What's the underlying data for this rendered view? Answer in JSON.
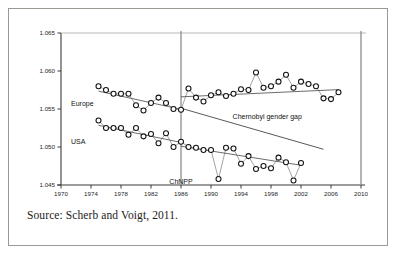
{
  "figure": {
    "source_caption": "Source: Scherb and Voigt, 2011."
  },
  "chart_data": {
    "type": "scatter",
    "title": "",
    "xlabel": "",
    "ylabel": "",
    "xlim": [
      1970,
      2010
    ],
    "ylim": [
      1.045,
      1.065
    ],
    "grid": false,
    "legend_position": "inline-labels",
    "xticks": [
      "1970",
      "1974",
      "1978",
      "1982",
      "1986",
      "1990",
      "1994",
      "1998",
      "2002",
      "2006",
      "2010"
    ],
    "xtick_values": [
      1970,
      1974,
      1978,
      1982,
      1986,
      1990,
      1994,
      1998,
      2002,
      2006,
      2010
    ],
    "yticks": [
      "1.065",
      "1.060",
      "1.055",
      "1.050",
      "1.045"
    ],
    "ytick_values": [
      1.065,
      1.06,
      1.055,
      1.05,
      1.045
    ],
    "series": [
      {
        "name": "Europe",
        "label": "Europe",
        "marker": "circle-open",
        "x": [
          1975,
          1976,
          1977,
          1978,
          1979,
          1980,
          1981,
          1982,
          1983,
          1984,
          1985,
          1986,
          1987,
          1988,
          1989,
          1990,
          1991,
          1992,
          1993,
          1994,
          1995,
          1996,
          1997,
          1998,
          1999,
          2000,
          2001,
          2002,
          2003,
          2004,
          2005,
          2006,
          2007
        ],
        "y": [
          1.058,
          1.0575,
          1.057,
          1.057,
          1.057,
          1.0555,
          1.0548,
          1.0558,
          1.0565,
          1.0558,
          1.055,
          1.0549,
          1.0577,
          1.0565,
          1.056,
          1.0568,
          1.0572,
          1.0567,
          1.057,
          1.0576,
          1.0575,
          1.0598,
          1.0578,
          1.058,
          1.0586,
          1.0595,
          1.0578,
          1.0586,
          1.0583,
          1.058,
          1.0564,
          1.0563,
          1.0572
        ]
      },
      {
        "name": "USA",
        "label": "USA",
        "marker": "circle-open",
        "x": [
          1975,
          1976,
          1977,
          1978,
          1979,
          1980,
          1981,
          1982,
          1983,
          1984,
          1985,
          1986,
          1987,
          1988,
          1989,
          1990,
          1991,
          1992,
          1993,
          1994,
          1995,
          1996,
          1997,
          1998,
          1999,
          2000,
          2001,
          2002
        ],
        "y": [
          1.0535,
          1.0525,
          1.0525,
          1.0525,
          1.0516,
          1.0525,
          1.0514,
          1.0517,
          1.0505,
          1.0518,
          1.05,
          1.0507,
          1.05,
          1.0499,
          1.0496,
          1.0496,
          1.0458,
          1.0499,
          1.0498,
          1.0478,
          1.0488,
          1.0471,
          1.0475,
          1.0472,
          1.0486,
          1.048,
          1.0456,
          1.0479
        ]
      }
    ],
    "trend_lines": [
      {
        "name": "europe-pre-1986",
        "x": [
          1975,
          1986
        ],
        "y": [
          1.05735,
          1.05495
        ]
      },
      {
        "name": "europe-post-1986",
        "x": [
          1986,
          2007
        ],
        "y": [
          1.0566,
          1.05755
        ]
      },
      {
        "name": "usa-pre-1986",
        "x": [
          1975,
          1986
        ],
        "y": [
          1.05285,
          1.0506
        ]
      },
      {
        "name": "usa-post-1986",
        "x": [
          1986,
          2002
        ],
        "y": [
          1.0501,
          1.0476
        ]
      }
    ],
    "annotations": [
      {
        "name": "chernobyl-gender-gap",
        "label": "Chernobyl gender gap",
        "x": 1997.5,
        "y": 1.0537
      },
      {
        "name": "chnpp-marker",
        "label": "ChNPP",
        "x": 1986,
        "y": 1.0451
      }
    ],
    "reference_lines": [
      {
        "name": "chnpp-vertical",
        "x": 1986
      },
      {
        "name": "right-edge-vertical",
        "x": 2010
      }
    ],
    "gap_line": {
      "name": "chernobyl-gap-line",
      "x": [
        1986,
        2005
      ],
      "y": [
        1.0551,
        1.0497
      ]
    }
  }
}
